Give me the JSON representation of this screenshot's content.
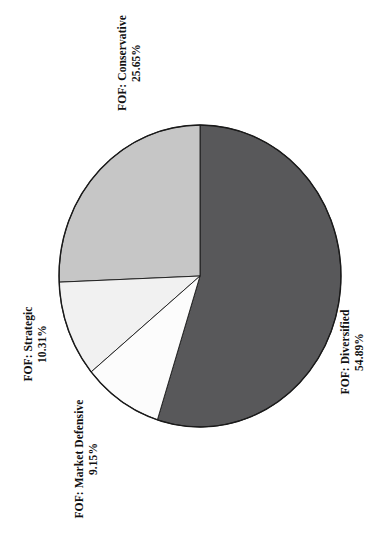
{
  "chart_data": {
    "type": "pie",
    "title": "",
    "subtitle": "",
    "xlabel": "",
    "ylabel": "",
    "legend_position": "none",
    "grid": false,
    "orientation": "rotated-90-ccw",
    "value_suffix": "%",
    "categories": [
      "FOF: Diversified",
      "FOF: Conservative",
      "FOF: Strategic",
      "FOF: Market Defensive"
    ],
    "values": [
      54.89,
      25.65,
      10.31,
      9.15
    ],
    "slices": [
      {
        "id": "diversified",
        "name": "FOF: Diversified",
        "value": 54.89,
        "value_label": "54.89%",
        "color": "#58585a",
        "start_angle": 0,
        "end_angle": 197.604
      },
      {
        "id": "conservative",
        "name": "FOF: Conservative",
        "value": 25.65,
        "value_label": "25.65%",
        "color": "#c6c6c6",
        "start_angle": 267.66,
        "end_angle": 360
      },
      {
        "id": "strategic",
        "name": "FOF: Strategic",
        "value": 10.31,
        "value_label": "10.31%",
        "color": "#f1f1f1",
        "start_angle": 230.544,
        "end_angle": 267.66
      },
      {
        "id": "market-defensive",
        "name": "FOF: Market Defensive",
        "value": 9.15,
        "value_label": "9.15%",
        "color": "#fcfcfc",
        "start_angle": 197.604,
        "end_angle": 230.544
      }
    ]
  },
  "labels": {
    "conservative": {
      "name": "FOF: Conservative",
      "value": "25.65%"
    },
    "diversified": {
      "name": "FOF: Diversified",
      "value": "54.89%"
    },
    "strategic": {
      "name": "FOF: Strategic",
      "value": "10.31%"
    },
    "market_defensive": {
      "name": "FOF: Market Defensive",
      "value": "9.15%"
    }
  },
  "colors": {
    "diversified": "#58585a",
    "conservative": "#c6c6c6",
    "strategic": "#f1f1f1",
    "market_defensive": "#fcfcfc",
    "outline": "#1a1a1a",
    "background": "#ffffff",
    "text": "#111111"
  }
}
